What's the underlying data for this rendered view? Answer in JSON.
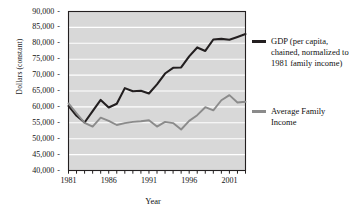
{
  "chart_data": {
    "type": "line",
    "title": "",
    "xlabel": "Year",
    "ylabel": "Dollars (constant)",
    "xlim": [
      1981,
      2003
    ],
    "ylim": [
      40000,
      90000
    ],
    "grid": true,
    "legend_position": "right",
    "y_ticks": [
      "40,000",
      "45,000",
      "50,000",
      "55,000",
      "60,000",
      "65,000",
      "70,000",
      "75,000",
      "80,000",
      "85,000",
      "90,000"
    ],
    "y_tick_values": [
      40000,
      45000,
      50000,
      55000,
      60000,
      65000,
      70000,
      75000,
      80000,
      85000,
      90000
    ],
    "x_ticks": [
      "1981",
      "1986",
      "1991",
      "1996",
      "2001"
    ],
    "x_tick_values": [
      1981,
      1986,
      1991,
      1996,
      2001
    ],
    "x": [
      1981,
      1982,
      1983,
      1984,
      1985,
      1986,
      1987,
      1988,
      1989,
      1990,
      1991,
      1992,
      1993,
      1994,
      1995,
      1996,
      1997,
      1998,
      1999,
      2000,
      2001,
      2002,
      2003
    ],
    "series": [
      {
        "name": "GDP (per capita, chained, normalized to 1981 family income)",
        "color": "#231f20",
        "values": [
          60300,
          57200,
          55100,
          58700,
          62200,
          59800,
          61000,
          65900,
          64900,
          65100,
          64200,
          67100,
          70500,
          72300,
          72400,
          75900,
          78700,
          77600,
          81200,
          81400,
          81100,
          82000,
          82900
        ]
      },
      {
        "name": "Average Family Income",
        "color": "#8b8b8b",
        "values": [
          61100,
          58000,
          55000,
          53800,
          56600,
          55600,
          54300,
          54900,
          55300,
          55500,
          55800,
          53800,
          55300,
          54900,
          52900,
          55600,
          57400,
          59900,
          58900,
          62100,
          63700,
          61400,
          61600
        ]
      }
    ],
    "plot_bg": "#d8d8d8",
    "gridline_color": "#ffffff",
    "axis_color": "#231f20"
  },
  "legend": {
    "entries": [
      {
        "label": "GDP (per capita, chained, normalized to 1981 family income)",
        "color": "#231f20"
      },
      {
        "label": "Average Family Income",
        "color": "#8b8b8b"
      }
    ]
  },
  "axes": {
    "y_title": "Dollars (constant)",
    "x_title": "Year"
  }
}
